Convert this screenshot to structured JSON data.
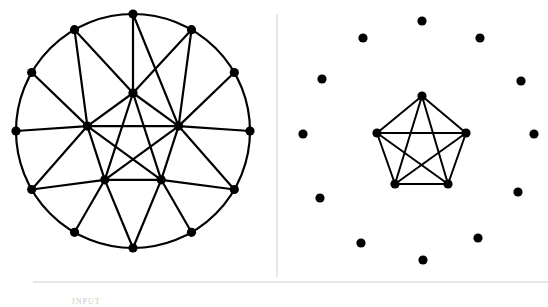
{
  "figure": {
    "background_color": "#ffffff",
    "ink_color": "#000000",
    "divider_color": "#d7d7d7",
    "width": 548,
    "height": 307
  },
  "captions": {
    "input_label": "INPUT"
  },
  "divider": {
    "x": 277,
    "y1": 14,
    "y2": 277,
    "color": "#d7d7d7"
  },
  "bottom_rule": {
    "x1": 33,
    "x2": 548,
    "y": 282,
    "color": "#cfcfcf"
  },
  "chart_data": {
    "type": "diagram",
    "panels": [
      {
        "name": "left-graph",
        "label": "Full graph with outer 12-cycle and inner K5",
        "center": [
          133,
          131
        ],
        "outer_radius": 117,
        "inner_radius": 48,
        "outer_node_count": 12,
        "inner_node_count": 5,
        "node_radius": 4.6,
        "edge_width": 2.2,
        "outer_nodes": [
          {
            "id": "o0",
            "x": 133,
            "y": 14
          },
          {
            "id": "o1",
            "x": 191.5,
            "y": 29.7
          },
          {
            "id": "o2",
            "x": 234.3,
            "y": 72.5
          },
          {
            "id": "o3",
            "x": 250,
            "y": 131
          },
          {
            "id": "o4",
            "x": 234.3,
            "y": 189.5
          },
          {
            "id": "o5",
            "x": 191.5,
            "y": 232.3
          },
          {
            "id": "o6",
            "x": 133,
            "y": 248
          },
          {
            "id": "o7",
            "x": 74.5,
            "y": 232.3
          },
          {
            "id": "o8",
            "x": 31.7,
            "y": 189.5
          },
          {
            "id": "o9",
            "x": 16,
            "y": 131
          },
          {
            "id": "o10",
            "x": 31.7,
            "y": 72.5
          },
          {
            "id": "o11",
            "x": 74.5,
            "y": 29.7
          }
        ],
        "inner_nodes": [
          {
            "id": "i0",
            "x": 133,
            "y": 93
          },
          {
            "id": "i1",
            "x": 178.6,
            "y": 126.1
          },
          {
            "id": "i2",
            "x": 161.2,
            "y": 179.8
          },
          {
            "id": "i3",
            "x": 104.8,
            "y": 179.8
          },
          {
            "id": "i4",
            "x": 87.4,
            "y": 126.1
          }
        ],
        "outer_cycle_edges": [
          [
            "o0",
            "o1"
          ],
          [
            "o1",
            "o2"
          ],
          [
            "o2",
            "o3"
          ],
          [
            "o3",
            "o4"
          ],
          [
            "o4",
            "o5"
          ],
          [
            "o5",
            "o6"
          ],
          [
            "o6",
            "o7"
          ],
          [
            "o7",
            "o8"
          ],
          [
            "o8",
            "o9"
          ],
          [
            "o9",
            "o10"
          ],
          [
            "o10",
            "o11"
          ],
          [
            "o11",
            "o0"
          ]
        ],
        "inner_pentagon_edges": [
          [
            "i0",
            "i1"
          ],
          [
            "i1",
            "i2"
          ],
          [
            "i2",
            "i3"
          ],
          [
            "i3",
            "i4"
          ],
          [
            "i4",
            "i0"
          ]
        ],
        "inner_pentagram_edges": [
          [
            "i0",
            "i2"
          ],
          [
            "i0",
            "i3"
          ],
          [
            "i1",
            "i3"
          ],
          [
            "i1",
            "i4"
          ],
          [
            "i2",
            "i4"
          ]
        ],
        "spoke_edges": [
          [
            "i0",
            "o0"
          ],
          [
            "i0",
            "o11"
          ],
          [
            "i0",
            "o1"
          ],
          [
            "i1",
            "o2"
          ],
          [
            "i1",
            "o3"
          ],
          [
            "i1",
            "o1"
          ],
          [
            "i1",
            "o0"
          ],
          [
            "i1",
            "o4"
          ],
          [
            "i2",
            "o4"
          ],
          [
            "i2",
            "o5"
          ],
          [
            "i2",
            "o6"
          ],
          [
            "i3",
            "o6"
          ],
          [
            "i3",
            "o7"
          ],
          [
            "i3",
            "o8"
          ],
          [
            "i4",
            "o8"
          ],
          [
            "i4",
            "o9"
          ],
          [
            "i4",
            "o10"
          ],
          [
            "i4",
            "o11"
          ]
        ]
      },
      {
        "name": "right-graph",
        "label": "Extracted K5 clique with 12 isolated vertices",
        "center": [
          418,
          134
        ],
        "isolated_ring_radius": 116,
        "isolated_node_count": 12,
        "clique_node_count": 5,
        "clique_radius": 48,
        "node_radius": 4.6,
        "edge_width": 2.0,
        "isolated_nodes": [
          {
            "id": "p0",
            "x": 422,
            "y": 21
          },
          {
            "id": "p1",
            "x": 480,
            "y": 38
          },
          {
            "id": "p2",
            "x": 521,
            "y": 81
          },
          {
            "id": "p3",
            "x": 534,
            "y": 134
          },
          {
            "id": "p4",
            "x": 518,
            "y": 192
          },
          {
            "id": "p5",
            "x": 478,
            "y": 238
          },
          {
            "id": "p6",
            "x": 423,
            "y": 260
          },
          {
            "id": "p7",
            "x": 361,
            "y": 243
          },
          {
            "id": "p8",
            "x": 320,
            "y": 198
          },
          {
            "id": "p9",
            "x": 303,
            "y": 134
          },
          {
            "id": "p10",
            "x": 322,
            "y": 79
          },
          {
            "id": "p11",
            "x": 363,
            "y": 38
          }
        ],
        "clique_nodes": [
          {
            "id": "k0",
            "x": 422,
            "y": 96
          },
          {
            "id": "k1",
            "x": 466,
            "y": 133
          },
          {
            "id": "k2",
            "x": 448,
            "y": 184
          },
          {
            "id": "k3",
            "x": 395,
            "y": 184
          },
          {
            "id": "k4",
            "x": 377,
            "y": 133
          }
        ],
        "clique_edges": [
          [
            "k0",
            "k1"
          ],
          [
            "k1",
            "k2"
          ],
          [
            "k2",
            "k3"
          ],
          [
            "k3",
            "k4"
          ],
          [
            "k4",
            "k0"
          ],
          [
            "k0",
            "k2"
          ],
          [
            "k0",
            "k3"
          ],
          [
            "k1",
            "k3"
          ],
          [
            "k1",
            "k4"
          ],
          [
            "k2",
            "k4"
          ]
        ]
      }
    ]
  }
}
